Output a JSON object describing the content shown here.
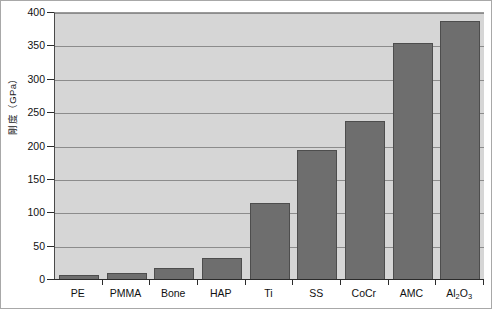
{
  "chart_data": {
    "type": "bar",
    "title": "",
    "xlabel": "",
    "ylabel": "剛度（GPa）",
    "ylim": [
      0,
      400
    ],
    "ytick_interval": 50,
    "grid": true,
    "legend": "none",
    "categories": [
      "PE",
      "PMMA",
      "Bone",
      "HAP",
      "Ti",
      "SS",
      "CoCr",
      "AMC",
      "Al2O3"
    ],
    "category_labels_display": [
      "PE",
      "PMMA",
      "Bone",
      "HAP",
      "Ti",
      "SS",
      "CoCr",
      "Al2O3_special"
    ],
    "values": [
      7,
      10,
      18,
      33,
      115,
      195,
      238,
      355,
      388
    ],
    "ytick_labels": [
      "0",
      "50",
      "100",
      "150",
      "200",
      "250",
      "300",
      "350",
      "400"
    ],
    "colors": {
      "bar_fill": "#6e6e6e",
      "bar_edge": "#4d4d4d",
      "plot_background": "#d6d6d6",
      "gridline": "#8c8c8c",
      "axis": "#2b2b2b",
      "figure_background": "#ffffff",
      "frame_border": "#a8a8a8",
      "text": "#111111"
    }
  },
  "axis": {
    "y_title": "剛度（GPa）",
    "ticks": [
      {
        "label": "400",
        "value": 400
      },
      {
        "label": "350",
        "value": 350
      },
      {
        "label": "300",
        "value": 300
      },
      {
        "label": "250",
        "value": 250
      },
      {
        "label": "200",
        "value": 200
      },
      {
        "label": "150",
        "value": 150
      },
      {
        "label": "100",
        "value": 100
      },
      {
        "label": "50",
        "value": 50
      },
      {
        "label": "0",
        "value": 0
      }
    ]
  },
  "bars": [
    {
      "category": "PE",
      "label": "PE",
      "value": 7,
      "subscripts": null
    },
    {
      "category": "PMMA",
      "label": "PMMA",
      "value": 10,
      "subscripts": null
    },
    {
      "category": "Bone",
      "label": "Bone",
      "value": 18,
      "subscripts": null
    },
    {
      "category": "HAP",
      "label": "HAP",
      "value": 33,
      "subscripts": null
    },
    {
      "category": "Ti",
      "label": "Ti",
      "value": 115,
      "subscripts": null
    },
    {
      "category": "SS",
      "label": "SS",
      "value": 195,
      "subscripts": null
    },
    {
      "category": "CoCr",
      "label": "CoCr",
      "value": 238,
      "subscripts": null
    },
    {
      "category": "AMC",
      "label": "AMC",
      "value": 355,
      "subscripts": null
    },
    {
      "category": "Al2O3",
      "label": "Al2O3",
      "value": 388,
      "subscripts": {
        "base1": "Al",
        "sub1": "2",
        "base2": "O",
        "sub2": "3"
      }
    }
  ]
}
